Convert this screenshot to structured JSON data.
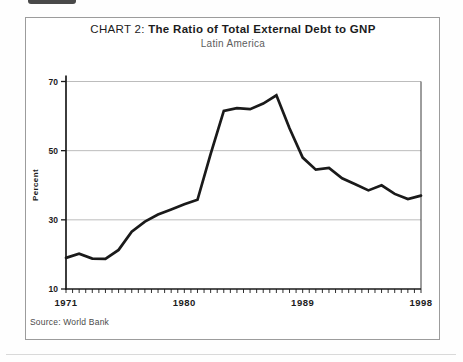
{
  "header": {
    "title_prefix": "CHART 2:",
    "title_main": " The Ratio of Total External Debt to GNP",
    "subtitle": "Latin America"
  },
  "footer": {
    "source": "Source: World Bank"
  },
  "colors": {
    "line": "#1a1a1a",
    "grid": "#bcbcbc",
    "axis": "#1a1a1a",
    "frame_border": "#9c9c9c"
  },
  "chart_data": {
    "type": "line",
    "title": "CHART 2: The Ratio of Total External Debt to GNP",
    "subtitle": "Latin America",
    "xlabel": "",
    "ylabel": "Percent",
    "ylim": [
      10,
      70
    ],
    "y_ticks": [
      10,
      30,
      50,
      70
    ],
    "gridlines": [
      30,
      50,
      70
    ],
    "grid": "horizontal-only",
    "legend": "none",
    "x_tick_labels": [
      "1971",
      "1980",
      "1989",
      "1998"
    ],
    "x": [
      1971,
      1972,
      1973,
      1974,
      1975,
      1976,
      1977,
      1978,
      1979,
      1980,
      1981,
      1982,
      1983,
      1984,
      1985,
      1986,
      1987,
      1988,
      1989,
      1990,
      1991,
      1992,
      1993,
      1994,
      1995,
      1996,
      1997,
      1998
    ],
    "values": [
      19,
      20.2,
      18.8,
      18.7,
      21.3,
      26.6,
      29.5,
      31.5,
      33,
      34.5,
      35.8,
      49,
      61.5,
      62.3,
      62,
      63.6,
      66,
      56.5,
      48,
      44.5,
      45,
      42,
      40.3,
      38.5,
      40,
      37.5,
      36,
      37
    ]
  }
}
